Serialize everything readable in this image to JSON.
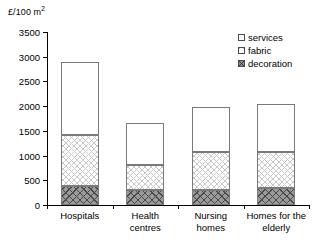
{
  "axis_unit_caption": {
    "prefix": "£/100 m",
    "superscript": "2"
  },
  "chart_data": {
    "type": "bar",
    "subtype": "stacked",
    "title": "",
    "xlabel": "",
    "ylabel": "£/100 m2",
    "ylim": [
      0,
      3500
    ],
    "yticks": [
      0,
      500,
      1000,
      1500,
      2000,
      2500,
      3000,
      3500
    ],
    "ytick_labels": [
      "0",
      "500",
      "1000",
      "1500",
      "2000",
      "2500",
      "3000",
      "3500"
    ],
    "grid": false,
    "legend_position": "top-right",
    "categories": [
      "Hospitals",
      "Health\ncentres",
      "Nursing\nhomes",
      "Homes for the\nelderly"
    ],
    "series": [
      {
        "name": "decoration",
        "values": [
          385,
          300,
          300,
          345
        ]
      },
      {
        "name": "fabric",
        "values": [
          1030,
          510,
          770,
          725
        ]
      },
      {
        "name": "services",
        "values": [
          1475,
          850,
          910,
          970
        ]
      }
    ],
    "cumulative_tops": {
      "decoration": [
        385,
        300,
        300,
        345
      ],
      "fabric": [
        1415,
        810,
        1070,
        1070
      ],
      "services": [
        2890,
        1660,
        1980,
        2040
      ]
    },
    "totals": [
      2890,
      1660,
      1980,
      2040
    ]
  },
  "legend": {
    "items": [
      {
        "label": "services",
        "swatch": "legend-swatch-services"
      },
      {
        "label": "fabric",
        "swatch": "legend-swatch-fabric"
      },
      {
        "label": "decoration",
        "swatch": "legend-swatch-decoration"
      }
    ]
  }
}
